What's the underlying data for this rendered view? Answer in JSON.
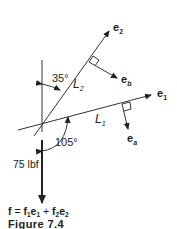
{
  "figure": {
    "caption": "Figure 7.4",
    "equation": {
      "lhs": "f",
      "eq": " = ",
      "t1_coef": "f",
      "t1_coef_sub": "1",
      "t1_vec": "e",
      "t1_vec_sub": "1",
      "plus": " + ",
      "t2_coef": "f",
      "t2_coef_sub": "2",
      "t2_vec": "e",
      "t2_vec_sub": "2"
    },
    "force_label": "75 lbf",
    "angles": {
      "angle_35": "35°",
      "angle_105": "105°"
    },
    "lines": {
      "L1": {
        "letter": "L",
        "sub": "1"
      },
      "L2": {
        "letter": "L",
        "sub": "2"
      }
    },
    "vectors": {
      "e1": {
        "letter": "e",
        "sub": "1"
      },
      "e2": {
        "letter": "e",
        "sub": "2"
      },
      "ea": {
        "letter": "e",
        "sub": "a"
      },
      "eb": {
        "letter": "e",
        "sub": "b"
      }
    }
  }
}
